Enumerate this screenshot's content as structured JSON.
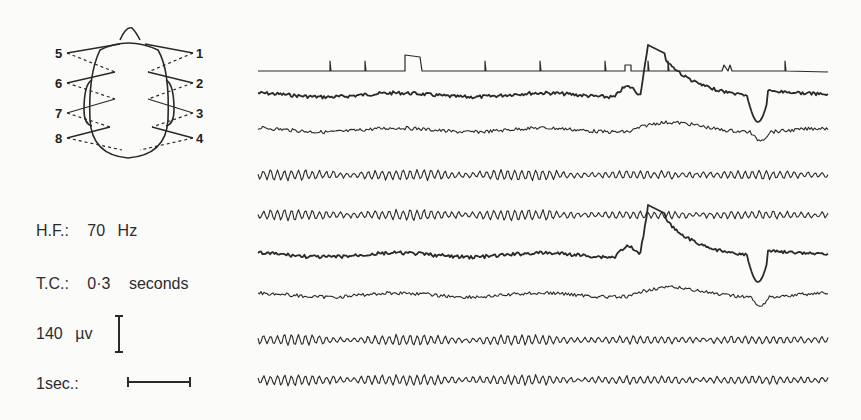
{
  "montage": {
    "electrodes_left": [
      "5",
      "6",
      "7",
      "8"
    ],
    "electrodes_right": [
      "1",
      "2",
      "3",
      "4"
    ]
  },
  "parameters": {
    "hf_label": "H.F.:",
    "hf_value": "70",
    "hf_unit": "Hz",
    "tc_label": "T.C.:",
    "tc_value": "0·3",
    "tc_unit": "seconds",
    "amp_value": "140",
    "amp_unit": "µv",
    "time_label": "1sec.:"
  },
  "chart_data": {
    "type": "line",
    "title": "",
    "xlabel": "",
    "ylabel": "",
    "grid": false,
    "calibration": {
      "amplitude": "140 µv",
      "time": "1 sec",
      "high_filter": "70 Hz",
      "time_constant": "0.3 seconds"
    },
    "series": [
      {
        "name": "marker",
        "baseline_y": 71,
        "events_x": [
          330,
          365,
          405,
          485,
          540,
          605,
          625,
          648,
          668,
          722,
          785
        ]
      },
      {
        "name": "ch1",
        "baseline_y": 95,
        "features": "high-amplitude deflection at x≈645 rising off-scale, slow decay to x≈760, sharp negative dip at x≈760"
      },
      {
        "name": "ch2",
        "baseline_y": 130,
        "features": "slow positive hump at x≈650, small dip at x≈760"
      },
      {
        "name": "ch3",
        "baseline_y": 175,
        "features": "alpha-like rhythmic activity"
      },
      {
        "name": "ch4",
        "baseline_y": 215,
        "features": "rhythmic activity, spike at x≈648"
      },
      {
        "name": "ch5",
        "baseline_y": 255,
        "features": "high-amplitude deflection at x≈648, slow decay, sharp negative dip at x≈758"
      },
      {
        "name": "ch6",
        "baseline_y": 295,
        "features": "slow hump at x≈655, dip at x≈757"
      },
      {
        "name": "ch7",
        "baseline_y": 340,
        "features": "rhythmic activity"
      },
      {
        "name": "ch8",
        "baseline_y": 380,
        "features": "rhythmic activity"
      }
    ]
  }
}
